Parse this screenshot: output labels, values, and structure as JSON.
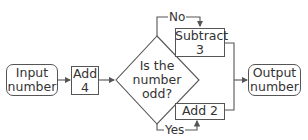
{
  "diagram": {
    "type": "flowchart",
    "nodes": {
      "input": {
        "shape": "rounded-rect",
        "line1": "Input",
        "line2": "number"
      },
      "add4": {
        "shape": "rect",
        "line1": "Add",
        "line2": "4"
      },
      "decision": {
        "shape": "diamond",
        "line1": "Is the",
        "line2": "number",
        "line3": "odd?"
      },
      "subtract3": {
        "shape": "rect",
        "line1": "Subtract",
        "line2": "3"
      },
      "add2": {
        "shape": "rect",
        "line1": "Add 2"
      },
      "output": {
        "shape": "rounded-rect",
        "line1": "Output",
        "line2": "number"
      }
    },
    "edges": {
      "no_label": "No",
      "yes_label": "Yes"
    },
    "colors": {
      "stroke": "#555555",
      "text": "#333333",
      "background": "#ffffff"
    }
  }
}
